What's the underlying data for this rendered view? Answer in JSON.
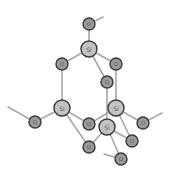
{
  "diagram": {
    "type": "molecular-structure",
    "colors": {
      "background": "#ffffff",
      "bond": "#a8a8a8",
      "oxygen_fill": "#9a9a9a",
      "silicon_fill": "#c2c2c2",
      "outline": "#3a3a3a",
      "label": "#555555"
    },
    "atoms": [
      {
        "id": "o_top",
        "element": "O",
        "label": "O",
        "x": 89,
        "y": 24,
        "r": 6
      },
      {
        "id": "si_top",
        "element": "Si",
        "label": "Si",
        "x": 89,
        "y": 49,
        "r": 8
      },
      {
        "id": "o_left",
        "element": "O",
        "label": "O",
        "x": 62,
        "y": 64,
        "r": 6
      },
      {
        "id": "o_right",
        "element": "O",
        "label": "O",
        "x": 116,
        "y": 64,
        "r": 6
      },
      {
        "id": "o_middle",
        "element": "O",
        "label": "O",
        "x": 107,
        "y": 82,
        "r": 6
      },
      {
        "id": "si_left",
        "element": "Si",
        "label": "Si",
        "x": 62,
        "y": 108,
        "r": 8
      },
      {
        "id": "si_right",
        "element": "Si",
        "label": "Si",
        "x": 116,
        "y": 108,
        "r": 8
      },
      {
        "id": "o_far_left",
        "element": "O",
        "label": "O",
        "x": 35,
        "y": 122,
        "r": 6
      },
      {
        "id": "o_center",
        "element": "O",
        "label": "O",
        "x": 89,
        "y": 124,
        "r": 6
      },
      {
        "id": "si_front",
        "element": "Si",
        "label": "Si",
        "x": 107,
        "y": 127,
        "r": 8
      },
      {
        "id": "o_far_right",
        "element": "O",
        "label": "O",
        "x": 143,
        "y": 123,
        "r": 6
      },
      {
        "id": "o_right_bottom",
        "element": "O",
        "label": "O",
        "x": 132,
        "y": 141,
        "r": 6
      },
      {
        "id": "o_lower_left",
        "element": "O",
        "label": "O",
        "x": 89,
        "y": 147,
        "r": 6
      },
      {
        "id": "o_bottom",
        "element": "O",
        "label": "O",
        "x": 121,
        "y": 159,
        "r": 6
      }
    ],
    "bonds": [
      {
        "from": "o_top",
        "to": "si_top"
      },
      {
        "from": "si_top",
        "to": "o_left"
      },
      {
        "from": "si_top",
        "to": "o_right"
      },
      {
        "from": "si_top",
        "to": "o_middle"
      },
      {
        "from": "o_left",
        "to": "si_left"
      },
      {
        "from": "o_right",
        "to": "si_right"
      },
      {
        "from": "o_middle",
        "to": "si_front"
      },
      {
        "from": "si_left",
        "to": "o_far_left"
      },
      {
        "from": "si_left",
        "to": "o_center"
      },
      {
        "from": "si_left",
        "to": "o_lower_left"
      },
      {
        "from": "o_center",
        "to": "si_right"
      },
      {
        "from": "si_right",
        "to": "o_far_right"
      },
      {
        "from": "si_right",
        "to": "o_right_bottom"
      },
      {
        "from": "si_front",
        "to": "o_lower_left"
      },
      {
        "from": "si_front",
        "to": "o_right_bottom"
      },
      {
        "from": "si_front",
        "to": "o_bottom"
      }
    ],
    "dangling_bonds": [
      {
        "from": "o_top",
        "x2": 103,
        "y2": 17
      },
      {
        "from": "o_far_left",
        "x2": 8,
        "y2": 107
      },
      {
        "from": "o_far_right",
        "x2": 162,
        "y2": 113
      },
      {
        "from": "o_bottom",
        "x2": 104,
        "y2": 154
      }
    ]
  }
}
